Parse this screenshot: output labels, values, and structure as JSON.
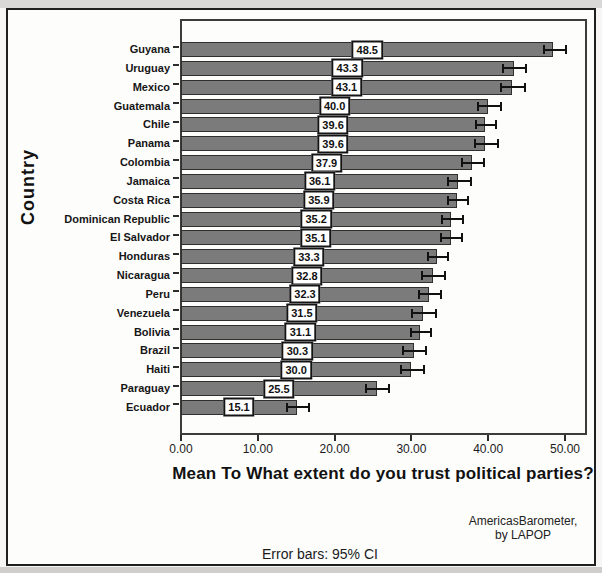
{
  "chart_data": {
    "type": "bar",
    "orientation": "horizontal",
    "title": "",
    "xlabel": "Mean To What extent do you trust political parties?",
    "ylabel": "Country",
    "xlim": [
      0,
      53
    ],
    "grid": false,
    "legend": "none",
    "bar_color": "#7b7b7b",
    "bar_border_color": "#2f2f2f",
    "xticks": [
      {
        "value": 0,
        "label": "0.00"
      },
      {
        "value": 10,
        "label": "10.00"
      },
      {
        "value": 20,
        "label": "20.00"
      },
      {
        "value": 30,
        "label": "30.00"
      },
      {
        "value": 40,
        "label": "40.00"
      },
      {
        "value": 50,
        "label": "50.00"
      }
    ],
    "rows": [
      {
        "country": "Guyana",
        "value": 48.5,
        "label": "48.5",
        "ci_low": 47.1,
        "ci_high": 50.0
      },
      {
        "country": "Uruguay",
        "value": 43.3,
        "label": "43.3",
        "ci_low": 41.8,
        "ci_high": 44.8
      },
      {
        "country": "Mexico",
        "value": 43.1,
        "label": "43.1",
        "ci_low": 41.6,
        "ci_high": 44.6
      },
      {
        "country": "Guatemala",
        "value": 40.0,
        "label": "40.0",
        "ci_low": 38.5,
        "ci_high": 41.5
      },
      {
        "country": "Chile",
        "value": 39.6,
        "label": "39.6",
        "ci_low": 38.3,
        "ci_high": 40.9
      },
      {
        "country": "Panama",
        "value": 39.6,
        "label": "39.6",
        "ci_low": 38.1,
        "ci_high": 41.1
      },
      {
        "country": "Colombia",
        "value": 37.9,
        "label": "37.9",
        "ci_low": 36.5,
        "ci_high": 39.3
      },
      {
        "country": "Jamaica",
        "value": 36.1,
        "label": "36.1",
        "ci_low": 34.6,
        "ci_high": 37.6
      },
      {
        "country": "Costa Rica",
        "value": 35.9,
        "label": "35.9",
        "ci_low": 34.6,
        "ci_high": 37.2
      },
      {
        "country": "Dominican Republic",
        "value": 35.2,
        "label": "35.2",
        "ci_low": 33.8,
        "ci_high": 36.6
      },
      {
        "country": "El Salvador",
        "value": 35.1,
        "label": "35.1",
        "ci_low": 33.7,
        "ci_high": 36.5
      },
      {
        "country": "Honduras",
        "value": 33.3,
        "label": "33.3",
        "ci_low": 32.0,
        "ci_high": 34.6
      },
      {
        "country": "Nicaragua",
        "value": 32.8,
        "label": "32.8",
        "ci_low": 31.3,
        "ci_high": 34.3
      },
      {
        "country": "Peru",
        "value": 32.3,
        "label": "32.3",
        "ci_low": 30.9,
        "ci_high": 33.7
      },
      {
        "country": "Venezuela",
        "value": 31.5,
        "label": "31.5",
        "ci_low": 29.9,
        "ci_high": 33.1
      },
      {
        "country": "Bolivia",
        "value": 31.1,
        "label": "31.1",
        "ci_low": 29.8,
        "ci_high": 32.4
      },
      {
        "country": "Brazil",
        "value": 30.3,
        "label": "30.3",
        "ci_low": 28.8,
        "ci_high": 31.8
      },
      {
        "country": "Haiti",
        "value": 30.0,
        "label": "30.0",
        "ci_low": 28.5,
        "ci_high": 31.5
      },
      {
        "country": "Paraguay",
        "value": 25.5,
        "label": "25.5",
        "ci_low": 24.0,
        "ci_high": 27.0
      },
      {
        "country": "Ecuador",
        "value": 15.1,
        "label": "15.1",
        "ci_low": 13.7,
        "ci_high": 16.5
      }
    ]
  },
  "notes": {
    "error_bars": "Error bars: 95% CI",
    "source_line1": "AmericasBarometer,",
    "source_line2": "by LAPOP"
  }
}
